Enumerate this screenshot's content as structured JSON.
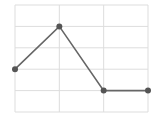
{
  "chart_data": {
    "type": "line",
    "title": "",
    "xlabel": "",
    "ylabel": "",
    "x": [
      0,
      1,
      2,
      3
    ],
    "series": [
      {
        "name": "",
        "values": [
          2,
          4,
          1,
          1
        ]
      }
    ],
    "xlim": [
      0,
      3
    ],
    "ylim": [
      0,
      5
    ],
    "x_gridlines": [
      0,
      1,
      2,
      3
    ],
    "y_gridlines": [
      0,
      1,
      2,
      3,
      4,
      5
    ],
    "grid": true,
    "legend": null,
    "tick_labels_visible": false,
    "markers": true
  },
  "style": {
    "line_color": "#666666",
    "marker_color": "#555555",
    "grid_color": "#dddddd",
    "background": "#ffffff"
  },
  "plot_area": {
    "left": 15,
    "top": 5,
    "right": 148,
    "bottom": 112
  }
}
